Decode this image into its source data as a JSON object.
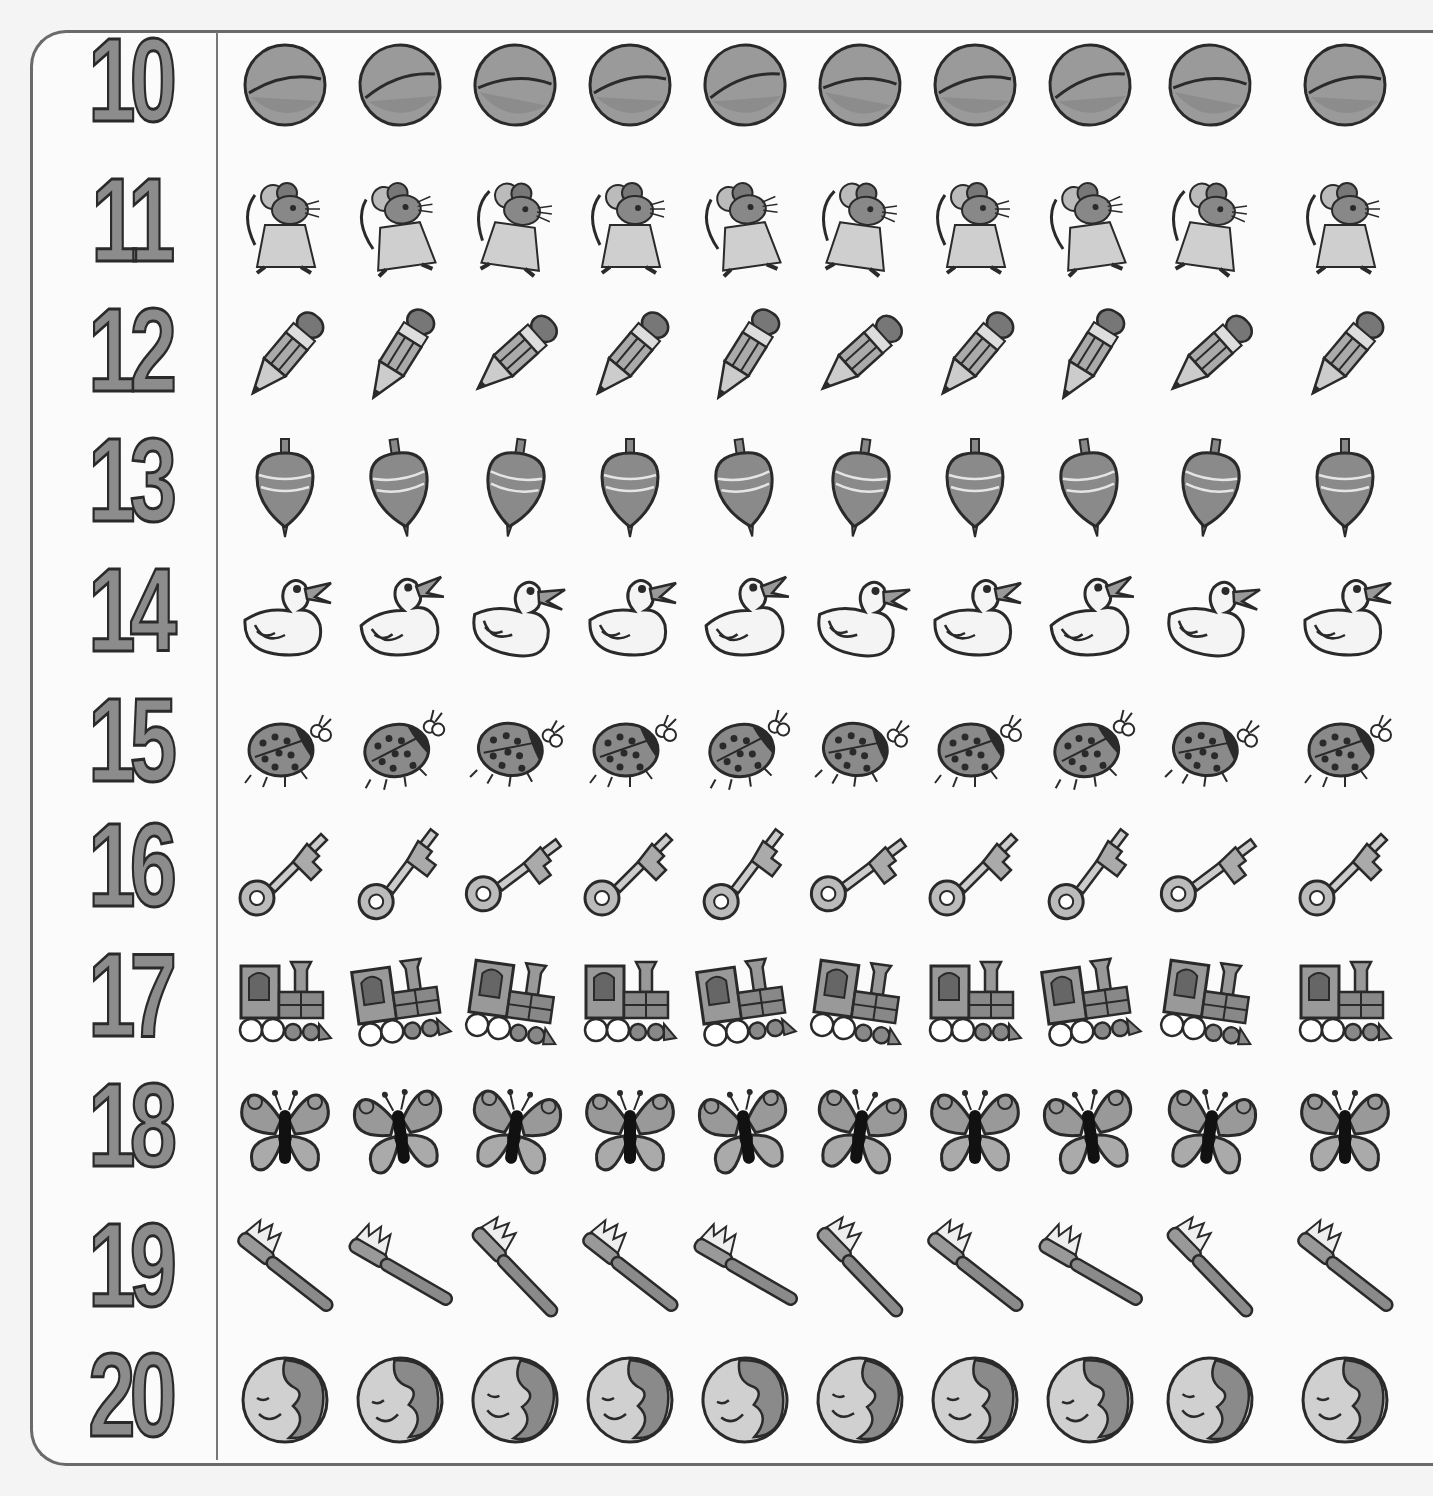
{
  "worksheet": {
    "type": "counting-chart",
    "colors": {
      "number_fill": "#8c8c8c",
      "outline": "#2a2a2a",
      "paper": "#fbfbfb",
      "border": "#6a6a6a"
    },
    "rows": [
      {
        "number": "10",
        "object": "ball",
        "count_shown": 10
      },
      {
        "number": "11",
        "object": "mouse",
        "count_shown": 10
      },
      {
        "number": "12",
        "object": "pencil",
        "count_shown": 10
      },
      {
        "number": "13",
        "object": "spinning-top",
        "count_shown": 10
      },
      {
        "number": "14",
        "object": "duck",
        "count_shown": 10
      },
      {
        "number": "15",
        "object": "ladybug",
        "count_shown": 10
      },
      {
        "number": "16",
        "object": "key",
        "count_shown": 10
      },
      {
        "number": "17",
        "object": "train",
        "count_shown": 10
      },
      {
        "number": "18",
        "object": "butterfly",
        "count_shown": 10
      },
      {
        "number": "19",
        "object": "toothbrush",
        "count_shown": 10
      },
      {
        "number": "20",
        "object": "moon",
        "count_shown": 10
      }
    ]
  }
}
